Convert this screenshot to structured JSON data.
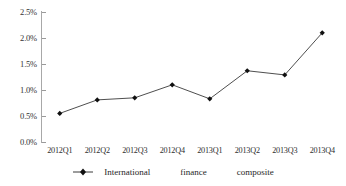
{
  "chart_data": {
    "type": "line",
    "title": "",
    "subtitle": "",
    "xlabel": "",
    "ylabel": "",
    "categories": [
      "2012Q1",
      "2012Q2",
      "2012Q3",
      "2012Q4",
      "2013Q1",
      "2013Q2",
      "2013Q3",
      "2013Q4"
    ],
    "values": [
      0.55,
      0.81,
      0.85,
      1.1,
      0.83,
      1.37,
      1.29,
      2.1
    ],
    "series": [
      {
        "name": "International finance composite",
        "values": [
          0.55,
          0.81,
          0.85,
          1.1,
          0.83,
          1.37,
          1.29,
          2.1
        ]
      }
    ],
    "value_format": "percent",
    "ylim": [
      0.0,
      2.5
    ],
    "ytick_values": [
      2.5,
      2.0,
      1.5,
      1.0,
      0.5,
      0.0
    ],
    "ytick_labels": [
      "2.5%",
      "2.0%",
      "1.5%",
      "1.0%",
      "0.5%",
      "0.0%"
    ],
    "grid": false,
    "legend_position": "bottom",
    "marker": "diamond",
    "line_color": "#3a3a3a",
    "marker_color": "#101010"
  },
  "axes": {
    "y": {
      "ticks": [
        {
          "label": "2.5%",
          "value": 2.5
        },
        {
          "label": "2.0%",
          "value": 2.0
        },
        {
          "label": "1.5%",
          "value": 1.5
        },
        {
          "label": "1.0%",
          "value": 1.0
        },
        {
          "label": "0.5%",
          "value": 0.5
        },
        {
          "label": "0.0%",
          "value": 0.0
        }
      ]
    },
    "x": {
      "ticks": [
        {
          "label": "2012Q1"
        },
        {
          "label": "2012Q2"
        },
        {
          "label": "2012Q3"
        },
        {
          "label": "2012Q4"
        },
        {
          "label": "2013Q1"
        },
        {
          "label": "2013Q2"
        },
        {
          "label": "2013Q3"
        },
        {
          "label": "2013Q4"
        }
      ]
    }
  },
  "legend": {
    "entries": [
      {
        "marker_name": "line-diamond-marker",
        "words": [
          "International",
          "finance",
          "composite"
        ],
        "label": "International finance composite"
      }
    ]
  },
  "colors": {
    "line": "#3a3a3a",
    "marker": "#101010",
    "axis": "#a8a8a8",
    "tick": "#9a9a9a",
    "text": "#2b2b2b",
    "background": "#ffffff"
  }
}
